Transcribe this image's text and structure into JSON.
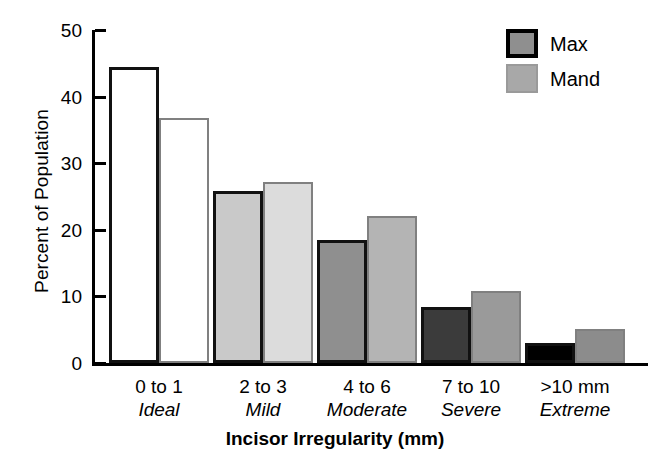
{
  "chart_data": {
    "type": "bar",
    "title": "",
    "xlabel": "Incisor Irregularity (mm)",
    "ylabel": "Percent of Population",
    "ylim": [
      0,
      50
    ],
    "yticks": [
      0,
      10,
      20,
      30,
      40,
      50
    ],
    "grid": false,
    "legend_position": "top-right",
    "categories": [
      "0 to 1",
      "2 to 3",
      "4 to 6",
      "7 to 10",
      ">10 mm"
    ],
    "category_sublabels": [
      "Ideal",
      "Mild",
      "Moderate",
      "Severe",
      "Extreme"
    ],
    "series": [
      {
        "name": "Max",
        "values": [
          44.4,
          25.8,
          18.4,
          8.4,
          3.0
        ],
        "fills": [
          "#ffffff",
          "#c9c9c9",
          "#8f8f8f",
          "#3b3b3b",
          "#000000"
        ],
        "stroke": "#111111"
      },
      {
        "name": "Mand",
        "values": [
          36.8,
          27.2,
          22.0,
          10.8,
          5.1
        ],
        "fills": [
          "#ffffff",
          "#dcdcdc",
          "#b4b4b4",
          "#9a9a9a",
          "#8c8c8c"
        ],
        "stroke": "#808080"
      }
    ]
  },
  "legend": {
    "items": [
      {
        "label": "Max",
        "fill": "#8f8f8f",
        "stroke": "#000000"
      },
      {
        "label": "Mand",
        "fill": "#a8a8a8",
        "stroke": "#9a9a9a"
      }
    ]
  },
  "axis": {
    "y_tick_labels": [
      "50",
      "40",
      "30",
      "20",
      "10",
      "0"
    ],
    "y_title": "Percent of Population",
    "x_title": "Incisor Irregularity (mm)"
  }
}
